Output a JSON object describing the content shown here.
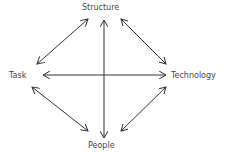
{
  "diagram": {
    "type": "relationship-diamond",
    "nodes": {
      "top": "Structure",
      "left": "Task",
      "right": "Technology",
      "bottom": "People"
    },
    "edges": [
      {
        "from": "Structure",
        "to": "Task",
        "direction": "bidirectional"
      },
      {
        "from": "Structure",
        "to": "Technology",
        "direction": "bidirectional"
      },
      {
        "from": "Structure",
        "to": "People",
        "direction": "bidirectional"
      },
      {
        "from": "Task",
        "to": "Technology",
        "direction": "bidirectional"
      },
      {
        "from": "Task",
        "to": "People",
        "direction": "bidirectional"
      },
      {
        "from": "Technology",
        "to": "People",
        "direction": "bidirectional"
      }
    ],
    "colors": {
      "line": "#333333",
      "text": "#444444",
      "background": "#ffffff"
    }
  }
}
